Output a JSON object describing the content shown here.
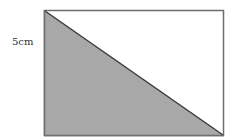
{
  "diagram": {
    "label_height": "5cm",
    "colors": {
      "shade": "#a8a8a8",
      "outline": "#6e6e6e",
      "diagonal": "#3a3a3a",
      "background": "#ffffff"
    },
    "rectangle": {
      "x": 44,
      "y": 10,
      "width": 180,
      "height": 126
    },
    "triangle": {
      "points": "44,10 44,136 224,136"
    }
  }
}
